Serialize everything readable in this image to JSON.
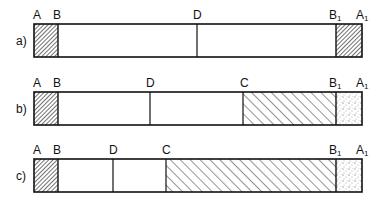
{
  "rows": [
    {
      "id": "a",
      "label": "a)",
      "points": {
        "A": "A",
        "B": "B",
        "D": "D",
        "B1": "B",
        "B1_sub": "1",
        "A1": "A",
        "A1_sub": "1"
      }
    },
    {
      "id": "b",
      "label": "b)",
      "points": {
        "A": "A",
        "B": "B",
        "D": "D",
        "C": "C",
        "B1": "B",
        "B1_sub": "1",
        "A1": "A",
        "A1_sub": "1"
      }
    },
    {
      "id": "c",
      "label": "c)",
      "points": {
        "A": "A",
        "B": "B",
        "D": "D",
        "C": "C",
        "B1": "B",
        "B1_sub": "1",
        "A1": "A",
        "A1_sub": "1"
      }
    }
  ],
  "legend_patterns": {
    "dense_hatch": "A–B segment",
    "wide_hatch": "C–B1 segment",
    "stipple": "B1–A1 segment"
  }
}
